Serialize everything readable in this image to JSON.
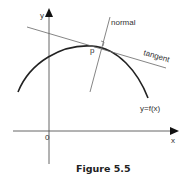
{
  "figure": {
    "caption": "Figure 5.5",
    "labels": {
      "y_axis": "y",
      "x_axis": "x",
      "origin": "0",
      "normal": "normal",
      "tangent": "tangent",
      "point": "p",
      "curve": "y=f(x)"
    },
    "colors": {
      "curve": "#222222",
      "axes": "#555555",
      "lines": "#666666",
      "text": "#333333"
    }
  }
}
